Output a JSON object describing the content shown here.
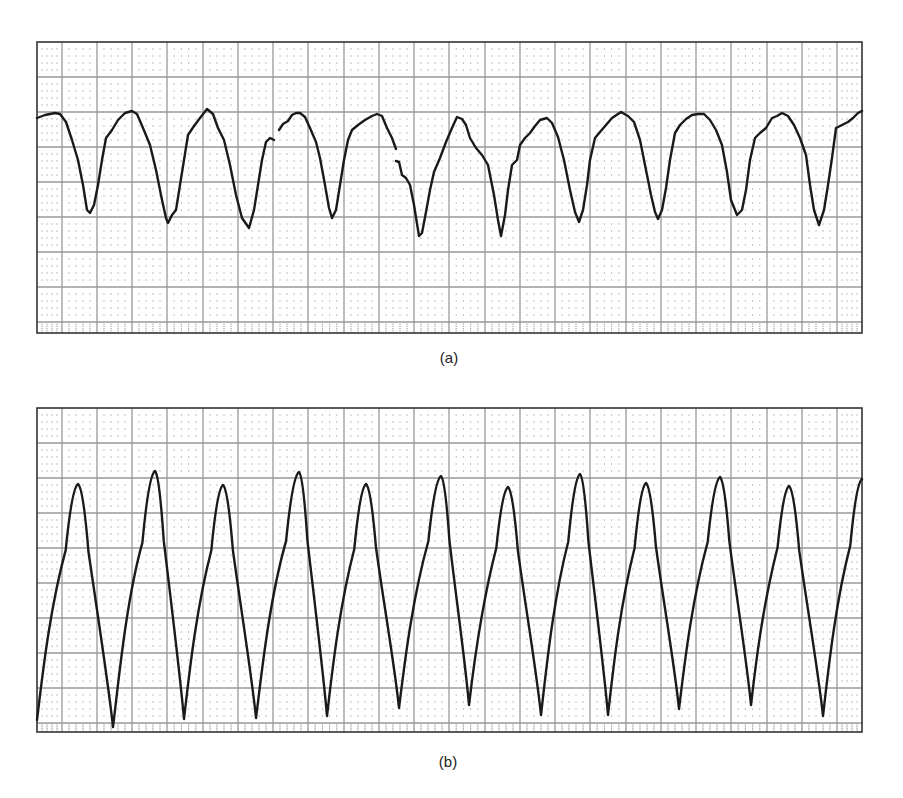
{
  "figure": {
    "panel_labels": [
      "(a)",
      "(b)"
    ]
  },
  "style": {
    "major_grid_color": "#9a9a9a",
    "minor_dot_color": "#a8a8a8",
    "border_color": "#333333",
    "trace_color": "#1a1a1a"
  },
  "chart_data": [
    {
      "type": "line",
      "title": "(a)",
      "description": "ECG rhythm strip on grid paper, sawtooth-like wide complex waveform with small discontinuities",
      "xlabel": "",
      "ylabel": "",
      "grid": true,
      "box": {
        "x": 37,
        "y": 42,
        "w": 825,
        "h": 291
      },
      "grid_v": [
        62,
        97,
        132,
        167,
        203,
        238,
        273,
        308,
        344,
        379,
        414,
        449,
        485,
        520,
        555,
        590,
        626,
        661,
        696,
        731,
        767,
        802,
        837
      ],
      "grid_h": [
        77,
        112,
        147,
        182,
        217,
        252,
        287,
        322
      ],
      "segments": [
        [
          [
            37,
            118
          ],
          [
            45,
            115
          ],
          [
            55,
            113
          ],
          [
            60,
            114
          ],
          [
            66,
            122
          ],
          [
            72,
            140
          ],
          [
            78,
            160
          ],
          [
            83,
            185
          ],
          [
            87,
            210
          ],
          [
            90,
            213
          ],
          [
            94,
            205
          ],
          [
            98,
            185
          ],
          [
            102,
            160
          ],
          [
            106,
            138
          ],
          [
            112,
            130
          ],
          [
            118,
            120
          ],
          [
            125,
            113
          ],
          [
            132,
            111
          ],
          [
            137,
            114
          ],
          [
            143,
            128
          ],
          [
            150,
            145
          ],
          [
            156,
            170
          ],
          [
            162,
            200
          ],
          [
            166,
            218
          ],
          [
            168,
            223
          ],
          [
            172,
            215
          ],
          [
            176,
            210
          ],
          [
            180,
            185
          ],
          [
            184,
            160
          ],
          [
            188,
            135
          ],
          [
            194,
            126
          ],
          [
            200,
            118
          ],
          [
            207,
            109
          ],
          [
            213,
            114
          ],
          [
            218,
            128
          ],
          [
            224,
            140
          ],
          [
            230,
            165
          ],
          [
            236,
            195
          ],
          [
            242,
            218
          ],
          [
            249,
            228
          ],
          [
            254,
            210
          ],
          [
            258,
            185
          ],
          [
            262,
            160
          ],
          [
            266,
            142
          ],
          [
            270,
            138
          ],
          [
            274,
            140
          ]
        ],
        [
          [
            279,
            130
          ],
          [
            283,
            124
          ],
          [
            288,
            121
          ],
          [
            292,
            115
          ],
          [
            296,
            113
          ],
          [
            300,
            113
          ],
          [
            305,
            117
          ],
          [
            310,
            128
          ],
          [
            316,
            142
          ],
          [
            320,
            158
          ],
          [
            325,
            185
          ],
          [
            329,
            208
          ],
          [
            332,
            218
          ],
          [
            336,
            210
          ],
          [
            340,
            185
          ],
          [
            344,
            160
          ],
          [
            348,
            140
          ],
          [
            352,
            130
          ],
          [
            358,
            125
          ],
          [
            365,
            120
          ],
          [
            372,
            116
          ],
          [
            377,
            114
          ],
          [
            382,
            116
          ],
          [
            387,
            128
          ],
          [
            392,
            138
          ],
          [
            396,
            149
          ]
        ],
        [
          [
            396,
            161
          ],
          [
            399,
            162
          ],
          [
            402,
            175
          ],
          [
            406,
            178
          ],
          [
            410,
            185
          ],
          [
            414,
            205
          ],
          [
            419,
            236
          ],
          [
            422,
            233
          ],
          [
            426,
            212
          ],
          [
            430,
            190
          ],
          [
            434,
            172
          ],
          [
            440,
            158
          ],
          [
            446,
            142
          ],
          [
            452,
            128
          ],
          [
            457,
            117
          ],
          [
            462,
            119
          ],
          [
            466,
            125
          ],
          [
            470,
            138
          ],
          [
            476,
            148
          ],
          [
            482,
            155
          ],
          [
            488,
            165
          ],
          [
            494,
            195
          ],
          [
            498,
            220
          ],
          [
            501,
            236
          ],
          [
            505,
            215
          ],
          [
            508,
            190
          ],
          [
            512,
            165
          ],
          [
            517,
            160
          ],
          [
            520,
            145
          ],
          [
            525,
            138
          ],
          [
            530,
            133
          ],
          [
            535,
            126
          ],
          [
            540,
            120
          ],
          [
            547,
            118
          ],
          [
            552,
            123
          ],
          [
            558,
            137
          ],
          [
            564,
            160
          ],
          [
            570,
            190
          ],
          [
            575,
            212
          ],
          [
            579,
            222
          ],
          [
            583,
            210
          ],
          [
            587,
            185
          ],
          [
            590,
            160
          ],
          [
            595,
            138
          ],
          [
            600,
            132
          ],
          [
            606,
            125
          ],
          [
            612,
            118
          ],
          [
            621,
            112
          ],
          [
            628,
            116
          ],
          [
            634,
            122
          ],
          [
            640,
            140
          ],
          [
            646,
            170
          ],
          [
            651,
            195
          ],
          [
            655,
            212
          ],
          [
            658,
            219
          ],
          [
            662,
            210
          ],
          [
            666,
            188
          ],
          [
            670,
            160
          ],
          [
            675,
            133
          ],
          [
            680,
            125
          ],
          [
            686,
            119
          ],
          [
            692,
            115
          ],
          [
            698,
            114
          ],
          [
            704,
            114
          ],
          [
            710,
            120
          ],
          [
            716,
            130
          ],
          [
            722,
            145
          ],
          [
            727,
            172
          ],
          [
            731,
            200
          ],
          [
            735,
            210
          ],
          [
            737,
            215
          ],
          [
            742,
            210
          ],
          [
            746,
            190
          ],
          [
            750,
            160
          ],
          [
            755,
            138
          ],
          [
            760,
            133
          ],
          [
            766,
            128
          ],
          [
            772,
            118
          ],
          [
            777,
            116
          ],
          [
            782,
            113
          ],
          [
            788,
            116
          ],
          [
            794,
            125
          ],
          [
            800,
            138
          ],
          [
            806,
            155
          ],
          [
            810,
            185
          ],
          [
            814,
            210
          ],
          [
            819,
            225
          ],
          [
            824,
            210
          ],
          [
            828,
            185
          ],
          [
            832,
            158
          ],
          [
            836,
            128
          ],
          [
            842,
            125
          ],
          [
            848,
            122
          ],
          [
            853,
            118
          ],
          [
            858,
            113
          ],
          [
            862,
            111
          ]
        ]
      ]
    },
    {
      "type": "line",
      "title": "(b)",
      "description": "ECG rhythm strip on grid paper, regular large-amplitude sinusoidal-like wide complex waveform",
      "xlabel": "",
      "ylabel": "",
      "grid": true,
      "box": {
        "x": 37,
        "y": 408,
        "w": 825,
        "h": 324
      },
      "grid_v": [
        62,
        97,
        132,
        167,
        203,
        238,
        273,
        308,
        344,
        379,
        414,
        449,
        485,
        520,
        555,
        590,
        626,
        661,
        696,
        731,
        767,
        802,
        837
      ],
      "grid_h": [
        443,
        478,
        513,
        548,
        583,
        618,
        653,
        688,
        723
      ],
      "peaks": [
        {
          "x": 78,
          "y": 484
        },
        {
          "x": 155,
          "y": 471
        },
        {
          "x": 223,
          "y": 485
        },
        {
          "x": 299,
          "y": 472
        },
        {
          "x": 366,
          "y": 484
        },
        {
          "x": 441,
          "y": 476
        },
        {
          "x": 508,
          "y": 487
        },
        {
          "x": 580,
          "y": 474
        },
        {
          "x": 646,
          "y": 483
        },
        {
          "x": 720,
          "y": 477
        },
        {
          "x": 789,
          "y": 486
        }
      ],
      "troughs": [
        {
          "x": 37,
          "y": 720
        },
        {
          "x": 113,
          "y": 727
        },
        {
          "x": 184,
          "y": 719
        },
        {
          "x": 256,
          "y": 718
        },
        {
          "x": 327,
          "y": 716
        },
        {
          "x": 399,
          "y": 708
        },
        {
          "x": 469,
          "y": 705
        },
        {
          "x": 541,
          "y": 715
        },
        {
          "x": 608,
          "y": 715
        },
        {
          "x": 679,
          "y": 709
        },
        {
          "x": 751,
          "y": 705
        },
        {
          "x": 823,
          "y": 716
        }
      ],
      "end_point": {
        "x": 862,
        "y": 479
      }
    }
  ]
}
